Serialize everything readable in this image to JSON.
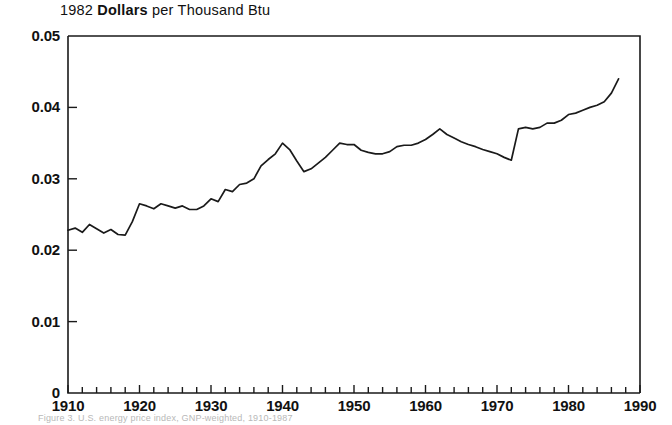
{
  "figure": {
    "title_main": "1982",
    "title_bold": "Dollars",
    "title_rest": "per  Thousand  Btu",
    "title_full": "1982 Dollars per Thousand Btu",
    "caption": "Figure 3.  U.S. energy price index, GNP-weighted, 1910-1987",
    "line_color": "#1a1a1a",
    "axis_color": "#1a1a1a",
    "background": "#ffffff"
  },
  "chart_data": {
    "type": "line",
    "title": "1982 Dollars per Thousand Btu",
    "xlabel": "",
    "ylabel": "1982 Dollars per Thousand Btu",
    "xlim": [
      1910,
      1990
    ],
    "ylim": [
      0,
      0.05
    ],
    "grid": false,
    "legend": "none",
    "x_major_ticks": [
      1910,
      1920,
      1930,
      1940,
      1950,
      1960,
      1970,
      1980,
      1990
    ],
    "x_tick_labels": [
      "1910",
      "1920",
      "1930",
      "1940",
      "1950",
      "1960",
      "1970",
      "1980",
      "1990"
    ],
    "x_minor_tick_interval": 2,
    "y_major_ticks": [
      0,
      0.01,
      0.02,
      0.03,
      0.04,
      0.05
    ],
    "y_tick_labels": [
      "0",
      "0.01",
      "0.02",
      "0.03",
      "0.04",
      "0.05"
    ],
    "series": [
      {
        "name": "Energy price index",
        "x": [
          1910,
          1911,
          1912,
          1913,
          1914,
          1915,
          1916,
          1917,
          1918,
          1919,
          1920,
          1921,
          1922,
          1923,
          1924,
          1925,
          1926,
          1927,
          1928,
          1929,
          1930,
          1931,
          1932,
          1933,
          1934,
          1935,
          1936,
          1937,
          1938,
          1939,
          1940,
          1941,
          1942,
          1943,
          1944,
          1945,
          1946,
          1947,
          1948,
          1949,
          1950,
          1951,
          1952,
          1953,
          1954,
          1955,
          1956,
          1957,
          1958,
          1959,
          1960,
          1961,
          1962,
          1963,
          1964,
          1965,
          1966,
          1967,
          1968,
          1969,
          1970,
          1971,
          1972,
          1973,
          1974,
          1975,
          1976,
          1977,
          1978,
          1979,
          1980,
          1981,
          1982,
          1983,
          1984,
          1985,
          1986,
          1987
        ],
        "y": [
          0.0228,
          0.0231,
          0.0225,
          0.0236,
          0.023,
          0.0224,
          0.0229,
          0.0222,
          0.0221,
          0.024,
          0.0265,
          0.0262,
          0.0258,
          0.0265,
          0.0262,
          0.0259,
          0.0262,
          0.0257,
          0.0257,
          0.0262,
          0.0272,
          0.0268,
          0.0285,
          0.0282,
          0.0292,
          0.0294,
          0.03,
          0.0318,
          0.0327,
          0.0335,
          0.035,
          0.0341,
          0.0325,
          0.031,
          0.0314,
          0.0322,
          0.033,
          0.034,
          0.035,
          0.0348,
          0.0348,
          0.034,
          0.0337,
          0.0335,
          0.0335,
          0.0338,
          0.0345,
          0.0347,
          0.0347,
          0.035,
          0.0355,
          0.0362,
          0.037,
          0.0362,
          0.0357,
          0.0352,
          0.0348,
          0.0345,
          0.0341,
          0.0338,
          0.0335,
          0.033,
          0.0326,
          0.037,
          0.0372,
          0.037,
          0.0372,
          0.0378,
          0.0378,
          0.0382,
          0.039,
          0.0392,
          0.0396,
          0.04,
          0.0403,
          0.0408,
          0.042,
          0.044
        ]
      }
    ]
  },
  "axes": {
    "plot_left_px": 68,
    "plot_right_px": 640,
    "plot_top_px": 36,
    "plot_bottom_px": 393
  }
}
